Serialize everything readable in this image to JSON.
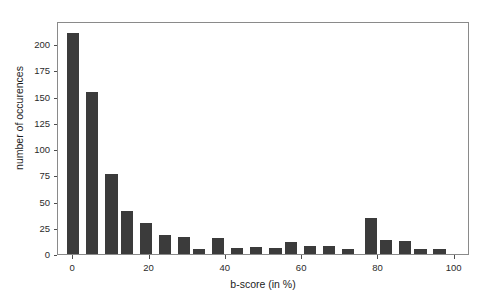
{
  "chart_data": {
    "type": "bar",
    "title": "",
    "subtitle": "",
    "xlabel": "b-score (in %)",
    "ylabel": "number of occurences",
    "xlim": [
      -4,
      104
    ],
    "ylim": [
      0,
      222
    ],
    "grid": false,
    "legend": null,
    "bar_color": "#3b3b3b",
    "background_color": "#ffffff",
    "panel_border_color": "#8a8a8a",
    "bar_width": 3.2,
    "xticks": [
      0,
      20,
      40,
      60,
      80,
      100
    ],
    "xtick_labels": [
      "0",
      "20",
      "40",
      "60",
      "80",
      "100"
    ],
    "yticks": [
      0,
      25,
      50,
      75,
      100,
      125,
      150,
      175,
      200
    ],
    "ytick_labels": [
      "0",
      "25",
      "50",
      "75",
      "100",
      "125",
      "150",
      "175",
      "200"
    ],
    "categories": [
      0,
      5,
      10,
      14,
      19,
      24,
      29,
      33,
      38,
      43,
      48,
      53,
      57,
      62,
      67,
      72,
      78,
      82,
      87,
      91,
      96
    ],
    "values": [
      211,
      154,
      76,
      41,
      30,
      18,
      16,
      5,
      15,
      6,
      7,
      6,
      11,
      8,
      8,
      5,
      34,
      13,
      12,
      5,
      5
    ]
  }
}
